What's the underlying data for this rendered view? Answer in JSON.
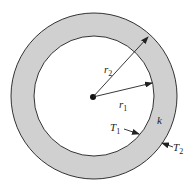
{
  "diagram": {
    "colors": {
      "background": "#ffffff",
      "shell_fill": "#d0d0d0",
      "stroke": "#333333",
      "text": "#222222"
    },
    "shapes": {
      "center": {
        "x": 94,
        "y": 97
      },
      "outer_radius": 83,
      "inner_radius": 60
    },
    "labels": {
      "r2": {
        "main": "r",
        "sub": "2"
      },
      "r1": {
        "main": "r",
        "sub": "1"
      },
      "k": {
        "main": "k"
      },
      "T1": {
        "main": "T",
        "sub": "1"
      },
      "T2": {
        "main": "T",
        "sub": "2"
      }
    }
  }
}
